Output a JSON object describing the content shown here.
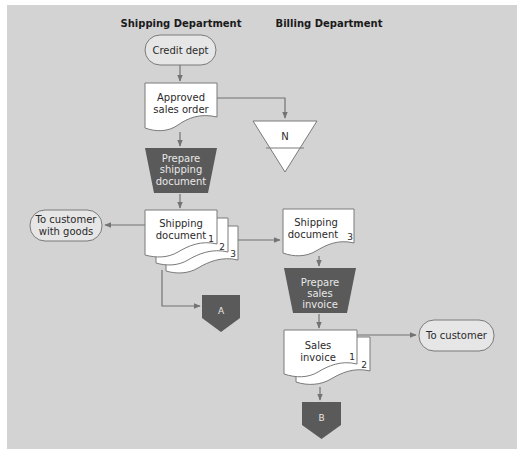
{
  "headers": {
    "shipping": "Shipping Department",
    "billing": "Billing Department"
  },
  "nodes": {
    "credit_dept": {
      "type": "terminator",
      "lines": [
        "Credit dept"
      ]
    },
    "approved_sales_order": {
      "type": "document",
      "lines": [
        "Approved",
        "sales order"
      ]
    },
    "file_n": {
      "type": "offline-file",
      "label": "N"
    },
    "prepare_shipping": {
      "type": "manual-operation",
      "lines": [
        "Prepare",
        "shipping",
        "document"
      ]
    },
    "shipping_doc_stack": {
      "type": "multi-document",
      "lines": [
        "Shipping",
        "document"
      ],
      "copies": [
        "1",
        "2",
        "3"
      ]
    },
    "to_customer_goods": {
      "type": "terminator",
      "lines": [
        "To customer",
        "with goods"
      ]
    },
    "connector_a": {
      "type": "off-page-connector",
      "label": "A"
    },
    "shipping_doc_3": {
      "type": "document",
      "lines": [
        "Shipping",
        "document"
      ],
      "copy": "3"
    },
    "prepare_invoice": {
      "type": "manual-operation",
      "lines": [
        "Prepare",
        "sales",
        "invoice"
      ]
    },
    "sales_invoice_stack": {
      "type": "multi-document",
      "lines": [
        "Sales",
        "invoice"
      ],
      "copies": [
        "1",
        "2"
      ]
    },
    "to_customer": {
      "type": "terminator",
      "lines": [
        "To customer"
      ]
    },
    "connector_b": {
      "type": "off-page-connector",
      "label": "B"
    }
  },
  "edges": [
    {
      "from": "credit_dept",
      "to": "approved_sales_order"
    },
    {
      "from": "approved_sales_order",
      "to": "file_n"
    },
    {
      "from": "approved_sales_order",
      "to": "prepare_shipping"
    },
    {
      "from": "prepare_shipping",
      "to": "shipping_doc_stack"
    },
    {
      "from": "shipping_doc_stack",
      "to": "to_customer_goods"
    },
    {
      "from": "shipping_doc_stack",
      "to": "shipping_doc_3"
    },
    {
      "from": "shipping_doc_stack",
      "to": "connector_a"
    },
    {
      "from": "shipping_doc_3",
      "to": "prepare_invoice"
    },
    {
      "from": "prepare_invoice",
      "to": "sales_invoice_stack"
    },
    {
      "from": "sales_invoice_stack",
      "to": "to_customer"
    },
    {
      "from": "sales_invoice_stack",
      "to": "connector_b"
    }
  ],
  "colors": {
    "panel": "#d3d3d3",
    "dark_shape": "#5a5a5a",
    "line": "#737373",
    "terminator_fill": "#e6e6e6"
  }
}
